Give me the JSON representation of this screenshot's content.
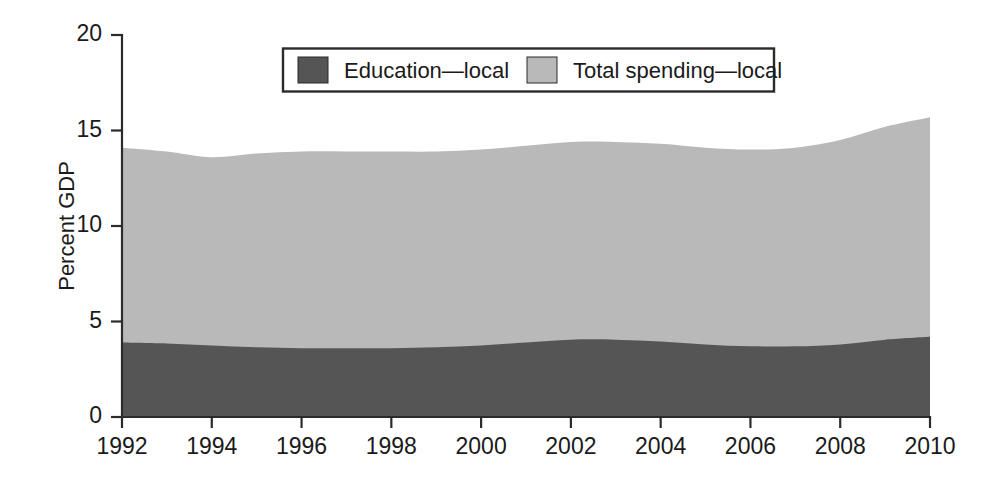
{
  "chart_data": {
    "type": "area",
    "title": "",
    "subtitle": "",
    "xlabel": "",
    "ylabel": "Percent GDP",
    "xlim": [
      1992,
      2010
    ],
    "ylim": [
      0,
      20
    ],
    "grid": false,
    "stacked": false,
    "legend_position": "top-center",
    "x_tick_labels": [
      "1992",
      "1994",
      "1996",
      "1998",
      "2000",
      "2002",
      "2004",
      "2006",
      "2008",
      "2010"
    ],
    "x_ticks": [
      1992,
      1994,
      1996,
      1998,
      2000,
      2002,
      2004,
      2006,
      2008,
      2010
    ],
    "y_tick_labels": [
      "0",
      "5",
      "10",
      "15",
      "20"
    ],
    "y_ticks": [
      0,
      5,
      10,
      15,
      20
    ],
    "x": [
      1992,
      1993,
      1994,
      1995,
      1996,
      1997,
      1998,
      1999,
      2000,
      2001,
      2002,
      2003,
      2004,
      2005,
      2006,
      2007,
      2008,
      2009,
      2010
    ],
    "series": [
      {
        "name": "Total spending—local",
        "color": "#b9b9b9",
        "values": [
          14.1,
          13.9,
          13.6,
          13.8,
          13.9,
          13.9,
          13.9,
          13.9,
          14.0,
          14.2,
          14.4,
          14.4,
          14.3,
          14.1,
          14.0,
          14.1,
          14.5,
          15.2,
          15.7
        ]
      },
      {
        "name": "Education—local",
        "color": "#555555",
        "values": [
          3.9,
          3.85,
          3.75,
          3.65,
          3.6,
          3.6,
          3.6,
          3.65,
          3.75,
          3.9,
          4.05,
          4.05,
          3.95,
          3.8,
          3.7,
          3.7,
          3.8,
          4.05,
          4.2
        ]
      }
    ]
  },
  "legend": {
    "items": [
      {
        "label": "Education—local",
        "color": "#555555"
      },
      {
        "label": "Total spending—local",
        "color": "#b9b9b9"
      }
    ]
  },
  "axes": {
    "y_title": "Percent GDP"
  }
}
